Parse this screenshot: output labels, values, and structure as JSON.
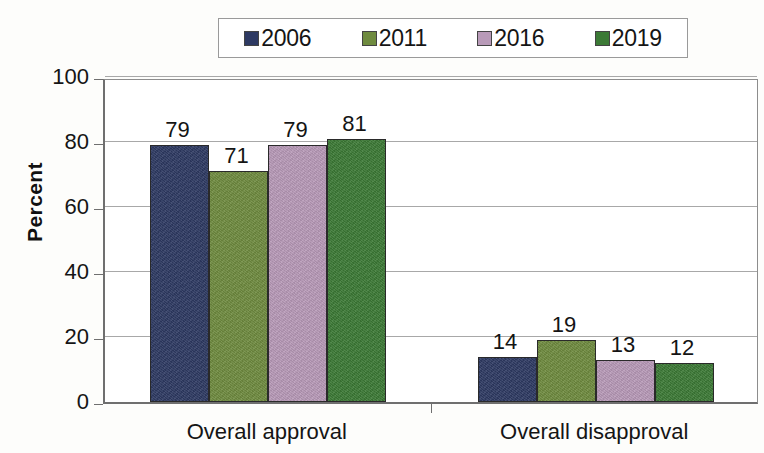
{
  "chart_data": {
    "type": "bar",
    "title": "",
    "subtitle": "",
    "xlabel": "",
    "ylabel": "Percent",
    "ylim": [
      0,
      100
    ],
    "yticks": [
      0,
      20,
      40,
      60,
      80,
      100
    ],
    "grid": true,
    "legend_position": "top",
    "categories": [
      "Overall approval",
      "Overall disapproval"
    ],
    "series": [
      {
        "name": "2006",
        "color": "#2e3a63",
        "values": [
          79,
          14
        ]
      },
      {
        "name": "2011",
        "color": "#6f8b3f",
        "values": [
          71,
          19
        ]
      },
      {
        "name": "2016",
        "color": "#b89ab8",
        "values": [
          79,
          13
        ]
      },
      {
        "name": "2019",
        "color": "#3c7a36",
        "values": [
          81,
          12
        ]
      }
    ],
    "data_labels": [
      [
        "79",
        "71",
        "79",
        "81"
      ],
      [
        "14",
        "19",
        "13",
        "12"
      ]
    ]
  },
  "legend": {
    "items": [
      {
        "label": "2006",
        "swatch": "legend-swatch-2006"
      },
      {
        "label": "2011",
        "swatch": "legend-swatch-2011"
      },
      {
        "label": "2016",
        "swatch": "legend-swatch-2016"
      },
      {
        "label": "2019",
        "swatch": "legend-swatch-2019"
      }
    ]
  },
  "axes": {
    "y_title": "Percent",
    "y_tick_labels": [
      "100",
      "80",
      "60",
      "40",
      "20",
      "0"
    ],
    "x_tick_labels": [
      "Overall approval",
      "Overall disapproval"
    ]
  }
}
